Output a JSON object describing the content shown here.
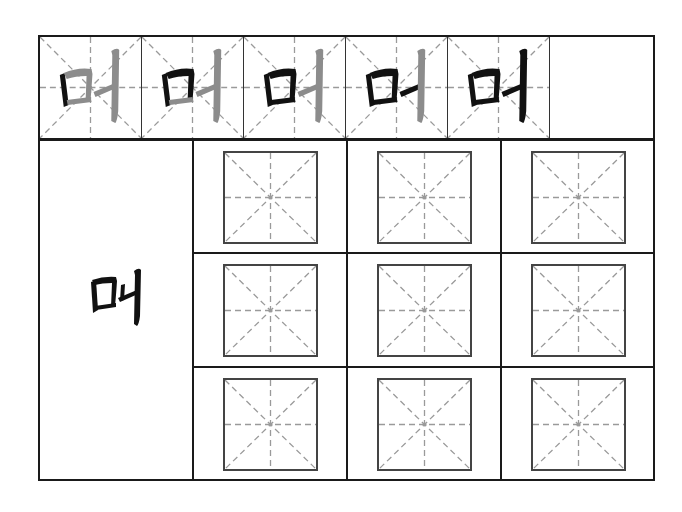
{
  "worksheet": {
    "character": "머",
    "stroke_order_cells": [
      {
        "step": 1,
        "black_strokes": 1
      },
      {
        "step": 2,
        "black_strokes": 2
      },
      {
        "step": 3,
        "black_strokes": 3
      },
      {
        "step": 4,
        "black_strokes": 4
      },
      {
        "step": 5,
        "black_strokes": 5
      }
    ],
    "practice_grid": {
      "rows": 3,
      "cols": 3
    },
    "colors": {
      "ink": "#111111",
      "trace_gray": "#8c8c8c",
      "guide_line": "#9a9a9a",
      "border": "#1a1a1a"
    }
  }
}
